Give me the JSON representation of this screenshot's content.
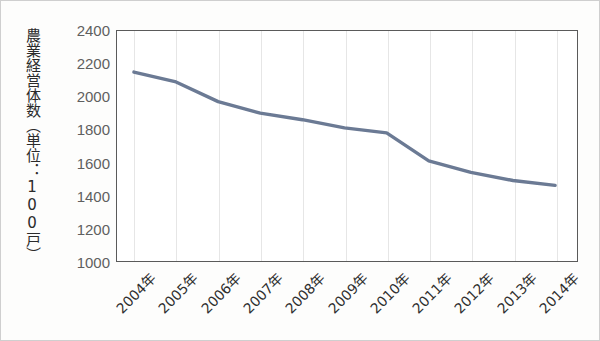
{
  "chart_data": {
    "type": "line",
    "title": "",
    "xlabel": "",
    "ylabel": "農業経営体数（単位：100戸）",
    "categories": [
      "2004年",
      "2005年",
      "2006年",
      "2007年",
      "2008年",
      "2009年",
      "2010年",
      "2011年",
      "2012年",
      "2013年",
      "2014年"
    ],
    "x": [
      2004,
      2005,
      2006,
      2007,
      2008,
      2009,
      2010,
      2011,
      2012,
      2013,
      2014
    ],
    "values": [
      2150,
      2090,
      1970,
      1900,
      1860,
      1810,
      1780,
      1610,
      1540,
      1490,
      1460
    ],
    "series": [
      {
        "name": "農業経営体数",
        "values": [
          2150,
          2090,
          1970,
          1900,
          1860,
          1810,
          1780,
          1610,
          1540,
          1490,
          1460
        ]
      }
    ],
    "ylim": [
      1000,
      2400
    ],
    "ytick_step": 200,
    "yticks": [
      2400,
      2200,
      2000,
      1800,
      1600,
      1400,
      1200,
      1000
    ],
    "ytick_labels": [
      "2400",
      "2200",
      "2000",
      "1800",
      "1600",
      "1400",
      "1200",
      "1000"
    ],
    "grid": "vertical-only",
    "legend": "none",
    "line_color": "#6b7a94",
    "plot_background": "#ffffff",
    "axis_color": "#5a5a5a",
    "gridline_color": "#e6e6e6",
    "xtick_rotation_deg": -45
  }
}
